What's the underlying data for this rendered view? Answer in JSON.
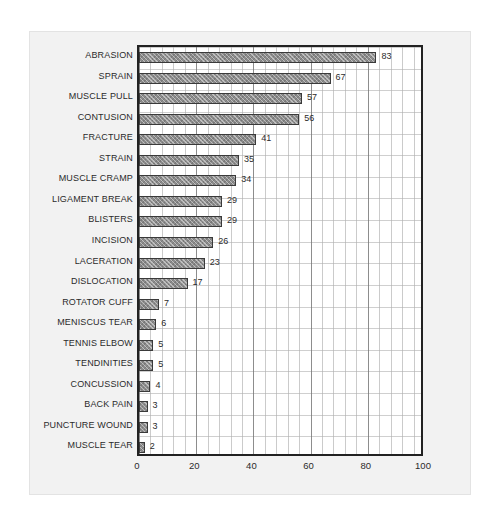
{
  "chart_data": {
    "type": "bar",
    "orientation": "horizontal",
    "title": "",
    "subtitle": "",
    "xlabel": "",
    "ylabel": "",
    "xlim": [
      0,
      100
    ],
    "xticks": [
      "0",
      "20",
      "40",
      "60",
      "80",
      "100"
    ],
    "grid": true,
    "legend": null,
    "bar_color": "#8c8c8c",
    "bar_border_color": "#3a3a3a",
    "plot_background": "#ffffff",
    "frame_background": "#f2f2f2",
    "categories": [
      "ABRASION",
      "SPRAIN",
      "MUSCLE PULL",
      "CONTUSION",
      "FRACTURE",
      "STRAIN",
      "MUSCLE CRAMP",
      "LIGAMENT BREAK",
      "BLISTERS",
      "INCISION",
      "LACERATION",
      "DISLOCATION",
      "ROTATOR CUFF",
      "MENISCUS TEAR",
      "TENNIS ELBOW",
      "TENDINITIES",
      "CONCUSSION",
      "BACK PAIN",
      "PUNCTURE WOUND",
      "MUSCLE TEAR"
    ],
    "values": [
      83,
      67,
      57,
      56,
      41,
      35,
      34,
      29,
      29,
      26,
      23,
      17,
      7,
      6,
      5,
      5,
      4,
      3,
      3,
      2
    ],
    "data_labels": [
      "83",
      "67",
      "57",
      "56",
      "41",
      "35",
      "34",
      "29",
      "29",
      "26",
      "23",
      "17",
      "7",
      "6",
      "5",
      "5",
      "4",
      "3",
      "3",
      "2"
    ]
  }
}
